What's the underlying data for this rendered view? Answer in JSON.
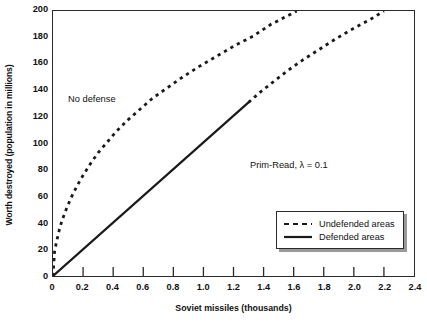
{
  "chart_data": {
    "type": "line",
    "title": "",
    "xlabel": "Soviet missiles (thousands)",
    "ylabel": "Worth destroyed (population in millions)",
    "xlim": [
      0,
      2.4
    ],
    "ylim": [
      0,
      200
    ],
    "xticks": [
      "0",
      "0.2",
      "0.4",
      "0.6",
      "0.8",
      "1.0",
      "1.2",
      "1.4",
      "1.6",
      "1.8",
      "2.0",
      "2.2",
      "2.4"
    ],
    "xtick_values": [
      0,
      0.2,
      0.4,
      0.6,
      0.8,
      1.0,
      1.2,
      1.4,
      1.6,
      1.8,
      2.0,
      2.2,
      2.4
    ],
    "yticks": [
      "0",
      "20",
      "40",
      "60",
      "80",
      "100",
      "120",
      "140",
      "160",
      "180",
      "200"
    ],
    "ytick_values": [
      0,
      20,
      40,
      60,
      80,
      100,
      120,
      140,
      160,
      180,
      200
    ],
    "grid": false,
    "legend_position": "lower-right",
    "series": [
      {
        "name": "No defense",
        "style": "dashed",
        "color": "#1a1a1a",
        "points": [
          [
            0.0,
            0
          ],
          [
            0.01,
            18
          ],
          [
            0.02,
            24
          ],
          [
            0.04,
            34
          ],
          [
            0.06,
            42
          ],
          [
            0.09,
            51
          ],
          [
            0.12,
            59
          ],
          [
            0.16,
            68
          ],
          [
            0.2,
            76
          ],
          [
            0.25,
            85
          ],
          [
            0.3,
            93
          ],
          [
            0.36,
            101
          ],
          [
            0.42,
            109
          ],
          [
            0.5,
            118
          ],
          [
            0.58,
            126
          ],
          [
            0.66,
            134
          ],
          [
            0.76,
            142
          ],
          [
            0.86,
            150
          ],
          [
            0.97,
            158
          ],
          [
            1.09,
            166
          ],
          [
            1.21,
            174
          ],
          [
            1.33,
            181
          ],
          [
            1.45,
            190
          ],
          [
            1.57,
            197
          ],
          [
            1.62,
            200
          ]
        ]
      },
      {
        "name": "Prim-Read, λ = 0.1",
        "style": "solid",
        "color": "#1a1a1a",
        "points": [
          [
            0.0,
            0
          ],
          [
            1.3,
            131
          ]
        ]
      },
      {
        "name": "Prim-Read continuation (undefended)",
        "style": "dashed",
        "color": "#1a1a1a",
        "points": [
          [
            1.3,
            131
          ],
          [
            1.38,
            139
          ],
          [
            1.47,
            147
          ],
          [
            1.56,
            155
          ],
          [
            1.66,
            163
          ],
          [
            1.77,
            171
          ],
          [
            1.88,
            179
          ],
          [
            2.0,
            187
          ],
          [
            2.1,
            193
          ],
          [
            2.2,
            200
          ]
        ]
      }
    ],
    "annotations": [
      {
        "text": "No defense",
        "x": 0.11,
        "y": 133
      },
      {
        "text": "Prim-Read, λ = 0.1",
        "x": 1.31,
        "y": 88
      }
    ],
    "legend": [
      {
        "label": "Undefended areas",
        "style": "dashed"
      },
      {
        "label": "Defended areas",
        "style": "solid"
      }
    ]
  }
}
